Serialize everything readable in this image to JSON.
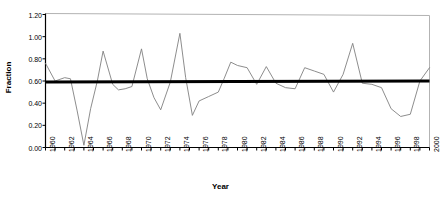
{
  "chart_data": {
    "type": "line",
    "title": "",
    "xlabel": "Year",
    "ylabel": "Fraction",
    "xlim": [
      1960,
      2000
    ],
    "ylim": [
      0.0,
      1.2
    ],
    "grid": false,
    "legend": null,
    "y_ticks": [
      "1.20",
      "1.00",
      "0.80",
      "0.60",
      "0.40",
      "0.20",
      "0.00"
    ],
    "y_tick_values": [
      1.2,
      1.0,
      0.8,
      0.6,
      0.4,
      0.2,
      0.0
    ],
    "x_tick_labels": [
      "1960",
      "1962",
      "1964",
      "1966",
      "1968",
      "1970",
      "1972",
      "1974",
      "1976",
      "1978",
      "1980",
      "1982",
      "1984",
      "1986",
      "1988",
      "1990",
      "1992",
      "1994",
      "1996",
      "1998",
      "2000"
    ],
    "x_tick_label_values": [
      1960,
      1962,
      1964,
      1966,
      1968,
      1970,
      1972,
      1974,
      1976,
      1978,
      1980,
      1982,
      1984,
      1986,
      1988,
      1990,
      1992,
      1994,
      1996,
      1998,
      2000
    ],
    "x_minor_ticks_every": 1,
    "colors": {
      "data_line": "#808080",
      "trend_line": "#000000",
      "axis": "#000000",
      "plot_border": "#b3b3b3",
      "background": "#ffffff"
    },
    "series": [
      {
        "name": "Fraction",
        "style": "thin-gray-line",
        "x": [
          1960,
          1961,
          1962,
          1963,
          1964,
          1965,
          1966,
          1967,
          1968,
          1969,
          1970,
          1971,
          1972,
          1973,
          1974,
          1975,
          1976,
          1977,
          1978,
          1979,
          1980,
          1981,
          1982,
          1983,
          1984,
          1985,
          1986,
          1987,
          1988,
          1989,
          1990,
          1991,
          1992,
          1993,
          1994,
          1995,
          1996,
          1997,
          1998,
          1999,
          2000
        ],
        "values": [
          0.76,
          0.6,
          0.63,
          0.62,
          0.02,
          0.6,
          0.87,
          0.57,
          0.52,
          0.53,
          0.89,
          0.57,
          0.34,
          0.59,
          1.03,
          0.29,
          0.42,
          0.46,
          0.5,
          0.77,
          0.74,
          0.72,
          0.57,
          0.73,
          0.58,
          0.54,
          0.53,
          0.72,
          0.69,
          0.66,
          0.5,
          0.66,
          0.94,
          0.58,
          0.57,
          0.54,
          0.35,
          0.28,
          0.3,
          0.6,
          0.72
        ]
      },
      {
        "name": "Trend",
        "style": "thick-black-line",
        "x": [
          1960,
          2000
        ],
        "values": [
          0.59,
          0.6
        ]
      }
    ],
    "series_full": {
      "note_points_x": [
        1960.0,
        1961.0,
        1962.0,
        1962.6,
        1963.3,
        1964.0,
        1964.7,
        1965.4,
        1966.0,
        1967.0,
        1967.6,
        1968.3,
        1969.0,
        1970.0,
        1970.6,
        1971.3,
        1972.0,
        1973.0,
        1974.0,
        1974.6,
        1975.3,
        1976.0,
        1977.0,
        1978.0,
        1978.6,
        1979.3,
        1980.0,
        1981.0,
        1982.0,
        1983.0,
        1984.0,
        1985.0,
        1986.0,
        1987.0,
        1988.0,
        1989.0,
        1990.0,
        1991.0,
        1992.0,
        1993.0,
        1994.0,
        1995.0,
        1996.0,
        1997.0,
        1998.0,
        1999.0,
        2000.0
      ],
      "note_points_y": [
        0.76,
        0.6,
        0.63,
        0.62,
        0.33,
        0.02,
        0.35,
        0.6,
        0.87,
        0.57,
        0.52,
        0.53,
        0.55,
        0.89,
        0.62,
        0.45,
        0.34,
        0.59,
        1.03,
        0.63,
        0.29,
        0.42,
        0.46,
        0.5,
        0.62,
        0.77,
        0.74,
        0.72,
        0.57,
        0.73,
        0.58,
        0.54,
        0.53,
        0.72,
        0.69,
        0.66,
        0.5,
        0.66,
        0.94,
        0.58,
        0.57,
        0.54,
        0.35,
        0.28,
        0.3,
        0.6,
        0.72
      ]
    },
    "data_points": [
      {
        "x": 1960,
        "y": 0.76
      },
      {
        "x": 1961,
        "y": 0.6
      },
      {
        "x": 1962,
        "y": 0.63
      },
      {
        "x": 1963,
        "y": 0.62
      },
      {
        "x": 1964,
        "y": 0.02
      },
      {
        "x": 1965,
        "y": 0.6
      },
      {
        "x": 1966,
        "y": 0.87
      },
      {
        "x": 1967,
        "y": 0.57
      },
      {
        "x": 1968,
        "y": 0.52
      },
      {
        "x": 1969,
        "y": 0.55
      },
      {
        "x": 1970,
        "y": 0.89
      },
      {
        "x": 1971,
        "y": 0.45
      },
      {
        "x": 1972,
        "y": 0.34
      },
      {
        "x": 1973,
        "y": 1.03
      },
      {
        "x": 1974,
        "y": 0.29
      },
      {
        "x": 1975,
        "y": 0.42
      },
      {
        "x": 1976,
        "y": 0.46
      },
      {
        "x": 1977,
        "y": 0.5
      },
      {
        "x": 1978,
        "y": 0.77
      },
      {
        "x": 1979,
        "y": 0.74
      },
      {
        "x": 1980,
        "y": 0.72
      },
      {
        "x": 1981,
        "y": 0.57
      },
      {
        "x": 1982,
        "y": 0.73
      },
      {
        "x": 1983,
        "y": 0.58
      },
      {
        "x": 1984,
        "y": 0.54
      },
      {
        "x": 1985,
        "y": 0.53
      },
      {
        "x": 1986,
        "y": 0.72
      },
      {
        "x": 1987,
        "y": 0.69
      },
      {
        "x": 1988,
        "y": 0.66
      },
      {
        "x": 1989,
        "y": 0.5
      },
      {
        "x": 1990,
        "y": 0.66
      },
      {
        "x": 1991,
        "y": 0.94
      },
      {
        "x": 1992,
        "y": 0.58
      },
      {
        "x": 1993,
        "y": 0.57
      },
      {
        "x": 1994,
        "y": 0.54
      },
      {
        "x": 1995,
        "y": 0.35
      },
      {
        "x": 1996,
        "y": 0.28
      },
      {
        "x": 1997,
        "y": 0.3
      },
      {
        "x": 1998,
        "y": 0.6
      },
      {
        "x": 1999,
        "y": 0.72
      },
      {
        "x": 2000,
        "y": 0.41
      }
    ]
  }
}
